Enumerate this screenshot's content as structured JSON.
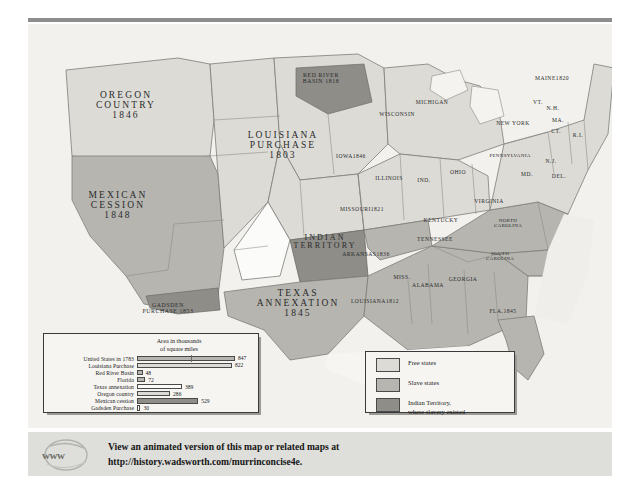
{
  "map": {
    "territories": [
      {
        "name": "OREGON\nCOUNTRY",
        "year": "1846",
        "x": 86,
        "y": 68
      },
      {
        "name": "MEXICAN\nCESSION",
        "year": "1848",
        "x": 79,
        "y": 168
      },
      {
        "name": "GADSDEN\nPURCHASE",
        "year": "1853",
        "x": 139,
        "y": 283
      },
      {
        "name": "LOUISIANA\nPURCHASE",
        "year": "1803",
        "x": 243,
        "y": 128
      },
      {
        "name": "RED RIVER\nBASIN",
        "year": "1818",
        "x": 292,
        "y": 72
      },
      {
        "name": "INDIAN\nTERRITORY",
        "year": "",
        "x": 303,
        "y": 240
      },
      {
        "name": "TEXAS\nANNEXATION",
        "year": "1845",
        "x": 272,
        "y": 288
      }
    ],
    "states": [
      {
        "label": "WISCONSIN",
        "year": "",
        "x": 397,
        "y": 116
      },
      {
        "label": "MICHIGAN",
        "year": "",
        "x": 432,
        "y": 104
      },
      {
        "label": "IOWA",
        "year": "1846",
        "x": 351,
        "y": 158
      },
      {
        "label": "ILLINOIS",
        "year": "",
        "x": 389,
        "y": 180
      },
      {
        "label": "IND.",
        "year": "",
        "x": 424,
        "y": 182
      },
      {
        "label": "OHIO",
        "year": "",
        "x": 458,
        "y": 174
      },
      {
        "label": "MISSOURI",
        "year": "1821",
        "x": 362,
        "y": 211
      },
      {
        "label": "KENTUCKY",
        "year": "",
        "x": 441,
        "y": 222
      },
      {
        "label": "VIRGINIA",
        "year": "",
        "x": 489,
        "y": 203
      },
      {
        "label": "TENNESSEE",
        "year": "",
        "x": 435,
        "y": 241
      },
      {
        "label": "ARKANSAS",
        "year": "1836",
        "x": 366,
        "y": 256
      },
      {
        "label": "MISS.",
        "year": "",
        "x": 402,
        "y": 279
      },
      {
        "label": "ALABAMA",
        "year": "",
        "x": 428,
        "y": 287
      },
      {
        "label": "GEORGIA",
        "year": "",
        "x": 463,
        "y": 281
      },
      {
        "label": "NORTH\nCAROLINA",
        "year": "",
        "x": 508,
        "y": 222
      },
      {
        "label": "SOUTH\nCAROLINA",
        "year": "",
        "x": 500,
        "y": 255
      },
      {
        "label": "LOUISIANA",
        "year": "1812",
        "x": 375,
        "y": 303
      },
      {
        "label": "FLA.",
        "year": "1845",
        "x": 503,
        "y": 313
      },
      {
        "label": "NEW YORK",
        "year": "",
        "x": 513,
        "y": 125
      },
      {
        "label": "PENNSYLVANIA",
        "year": "",
        "x": 510,
        "y": 157
      },
      {
        "label": "MAINE",
        "year": "1820",
        "x": 552,
        "y": 80
      },
      {
        "label": "VT.",
        "year": "",
        "x": 538,
        "y": 104
      },
      {
        "label": "N.H.",
        "year": "",
        "x": 553,
        "y": 110
      },
      {
        "label": "MA.",
        "year": "",
        "x": 558,
        "y": 122
      },
      {
        "label": "CT.",
        "year": "",
        "x": 556,
        "y": 133
      },
      {
        "label": "R.I.",
        "year": "",
        "x": 578,
        "y": 137
      },
      {
        "label": "N.J.",
        "year": "",
        "x": 551,
        "y": 163
      },
      {
        "label": "MD.",
        "year": "",
        "x": 527,
        "y": 176
      },
      {
        "label": "DEL.",
        "year": "",
        "x": 559,
        "y": 178
      }
    ]
  },
  "chart_data": {
    "type": "bar",
    "title": "Area in thousands\nof square miles",
    "xlabel": "",
    "ylabel": "",
    "orientation": "horizontal",
    "xlim": [
      0,
      900
    ],
    "grid": false,
    "categories": [
      "United States in 1783",
      "Louisiana Purchase",
      "Red River Basin",
      "Florida",
      "Texas annexation",
      "Oregon country",
      "Mexican cession",
      "Gadsden Purchase"
    ],
    "values": [
      847,
      822,
      48,
      72,
      389,
      286,
      529,
      30
    ],
    "labels": [
      "847",
      "822",
      "48",
      "72",
      "389",
      "286",
      "529",
      "30"
    ],
    "shades": [
      "mid",
      "light",
      "mid",
      "mid",
      "white",
      "light",
      "dark",
      "white"
    ]
  },
  "legend": {
    "items": [
      {
        "swatch": "free",
        "label": "Free states"
      },
      {
        "swatch": "slave",
        "label": "Slave states"
      },
      {
        "swatch": "ind",
        "label": "Indian Territory,\nwhere slavery existed"
      }
    ]
  },
  "footer": {
    "icon_text": "www",
    "line1": "View an animated version of this map or related maps at",
    "line2": "http://history.wadsworth.com/murrinconcise4e."
  },
  "colors": {
    "free_states": "#dcdbd6",
    "slave_states": "#b6b5b0",
    "indian_territory": "#8e8d88",
    "map_background": "#f2f1ee",
    "footer_background": "#dededa",
    "rule": "#8d8d8d"
  }
}
